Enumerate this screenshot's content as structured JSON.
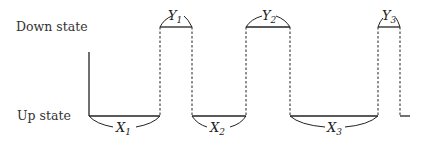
{
  "labels": {
    "down_state": "Down state",
    "up_state": "Up state"
  },
  "intervals": {
    "x": [
      {
        "name": "X",
        "sub": "1"
      },
      {
        "name": "X",
        "sub": "2"
      },
      {
        "name": "X",
        "sub": "3"
      }
    ],
    "y": [
      {
        "name": "Y",
        "sub": "1"
      },
      {
        "name": "Y",
        "sub": "2"
      },
      {
        "name": "Y",
        "sub": "3"
      }
    ]
  }
}
